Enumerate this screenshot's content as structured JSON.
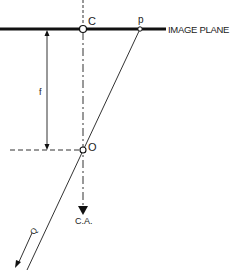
{
  "diagram": {
    "type": "pinhole-camera-geometry",
    "labels": {
      "image_plane": "IMAGE PLANE",
      "center_point": "C",
      "image_point": "p",
      "focal_length": "f",
      "optical_center": "O",
      "camera_axis": "C.A.",
      "ray_direction": "Q"
    },
    "colors": {
      "line": "#111111",
      "background": "#ffffff"
    },
    "geometry": {
      "image_plane_y": 29,
      "image_plane_x_start": 0,
      "image_plane_x_end": 166,
      "C": [
        83,
        29
      ],
      "p": [
        140,
        29
      ],
      "O": [
        83,
        150
      ],
      "f_arrow_x": 47
    }
  }
}
